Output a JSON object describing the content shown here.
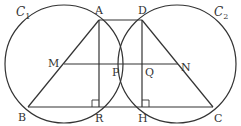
{
  "diagram": {
    "stroke_color": "#333333",
    "background": "#ffffff",
    "circles": [
      {
        "name": "C1",
        "label": "C",
        "subscript": "1",
        "cx": 64,
        "cy": 64,
        "r": 59,
        "label_x": 16,
        "label_y": 16
      },
      {
        "name": "C2",
        "label": "C",
        "subscript": "2",
        "cx": 177,
        "cy": 64,
        "r": 59,
        "label_x": 214,
        "label_y": 16
      }
    ],
    "points": {
      "A": {
        "label": "A",
        "x": 99,
        "y": 20,
        "lx": 95,
        "ly": 14
      },
      "D": {
        "label": "D",
        "x": 142,
        "y": 20,
        "lx": 138,
        "ly": 14
      },
      "M": {
        "label": "M",
        "x": 64,
        "y": 64,
        "lx": 48,
        "ly": 64
      },
      "N": {
        "label": "N",
        "x": 178,
        "y": 64,
        "lx": 182,
        "ly": 62
      },
      "P": {
        "label": "P",
        "x": 99,
        "y": 64,
        "lx": 112,
        "ly": 75
      },
      "Q": {
        "label": "Q",
        "x": 142,
        "y": 64,
        "lx": 124,
        "ly": 75
      },
      "B": {
        "label": "B",
        "x": 28,
        "y": 107,
        "lx": 18,
        "ly": 119
      },
      "R": {
        "label": "R",
        "x": 99,
        "y": 107,
        "lx": 95,
        "ly": 120
      },
      "H": {
        "label": "H",
        "x": 142,
        "y": 107,
        "lx": 138,
        "ly": 120
      },
      "C": {
        "label": "C",
        "x": 213,
        "y": 107,
        "lx": 214,
        "ly": 120
      }
    },
    "segments": [
      "AD",
      "AB",
      "AR",
      "DH",
      "DC",
      "BC",
      "MN"
    ],
    "right_angle_marks": [
      "R",
      "H"
    ]
  }
}
